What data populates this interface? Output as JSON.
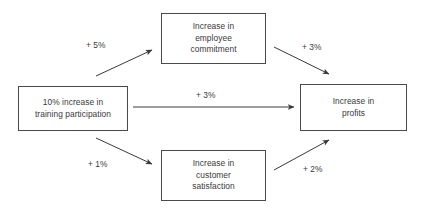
{
  "diagram": {
    "background_color": "#ffffff",
    "box_border_color": "#4a4a4a",
    "text_color": "#3a3a3a",
    "arrow_color": "#3a3a3a",
    "nodes": {
      "training": {
        "label": "10% increase in\ntraining participation",
        "x": 18,
        "y": 86,
        "w": 110,
        "h": 45
      },
      "employee_commitment": {
        "label": "Increase in\nemployee\ncommitment",
        "x": 161,
        "y": 13,
        "w": 105,
        "h": 51
      },
      "customer_satisfaction": {
        "label": "Increase in\ncustomer\nsatisfaction",
        "x": 161,
        "y": 150,
        "w": 105,
        "h": 51
      },
      "profits": {
        "label": "Increase in\nprofits",
        "x": 300,
        "y": 84,
        "w": 107,
        "h": 47
      }
    },
    "edges": {
      "training_to_commitment": {
        "label": "+ 5%",
        "label_x": 86,
        "label_y": 40
      },
      "commitment_to_profits": {
        "label": "+ 3%",
        "label_x": 302,
        "label_y": 42
      },
      "training_to_profits": {
        "label": "+ 3%",
        "label_x": 196,
        "label_y": 90
      },
      "training_to_satisfaction": {
        "label": "+ 1%",
        "label_x": 88,
        "label_y": 159
      },
      "satisfaction_to_profits": {
        "label": "+ 2%",
        "label_x": 303,
        "label_y": 164
      }
    }
  }
}
